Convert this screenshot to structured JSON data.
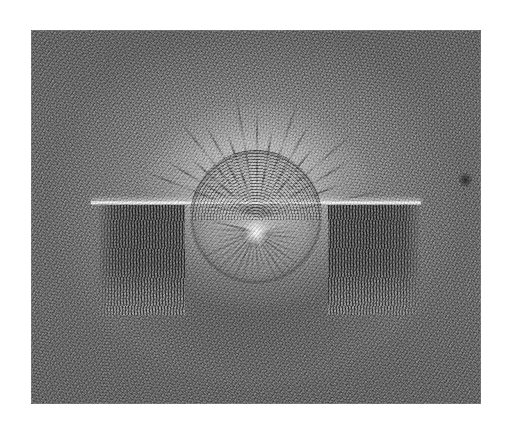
{
  "page": {
    "background_color": "#ffffff",
    "width": 509,
    "height": 431,
    "kind": "scanned-photograph-plate"
  },
  "photograph": {
    "caption": "",
    "subject": "Electric field lines revealed by fine particles suspended around a circular electrode above a horizontal plate electrode",
    "medium": "black-and-white halftone photograph",
    "frame": {
      "left": 31,
      "top": 30,
      "width": 450,
      "height": 374,
      "border_color": "#969696"
    },
    "tone": {
      "paper_white": "#ffffff",
      "field_mid_gray": "#8e8e8e",
      "halo_light": "#f2f2f2",
      "dense_dark": "#1e1e1e",
      "corner_gray": "#6f6f6f"
    },
    "elements": {
      "disc": {
        "label": "circular-electrode-disc",
        "center_x": 225,
        "center_y": 187,
        "diameter": 132
      },
      "plate_line": {
        "label": "horizontal-plate-electrode",
        "y": 171,
        "x_start": 60,
        "x_end": 390
      },
      "dark_band_left": {
        "label": "dense-particle-band-left",
        "x_start": 68,
        "x_end": 154
      },
      "dark_band_right": {
        "label": "dense-particle-band-right",
        "x_start": 297,
        "x_end": 389
      },
      "blemish": {
        "label": "emulsion-blemish",
        "x": 428,
        "y": 142
      }
    },
    "streak_count_upper": 17,
    "ray_count_disc": 22
  }
}
